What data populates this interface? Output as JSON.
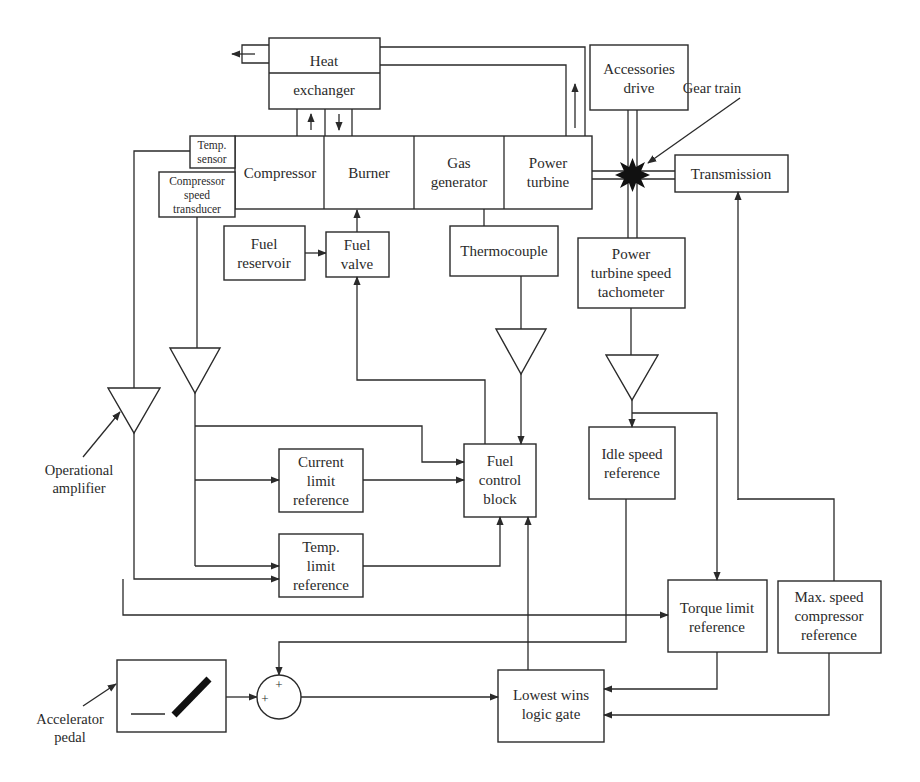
{
  "diagram": {
    "type": "block-diagram",
    "blocks": {
      "heat_exchanger": {
        "line1": "Heat",
        "line2": "exchanger"
      },
      "temp_sensor": {
        "line1": "Temp.",
        "line2": "sensor"
      },
      "compressor_speed_transducer": {
        "line1": "Compressor",
        "line2": "speed",
        "line3": "transducer"
      },
      "compressor": {
        "line1": "Compressor"
      },
      "burner": {
        "line1": "Burner"
      },
      "gas_generator": {
        "line1": "Gas",
        "line2": "generator"
      },
      "power_turbine": {
        "line1": "Power",
        "line2": "turbine"
      },
      "accessories_drive": {
        "line1": "Accessories",
        "line2": "drive"
      },
      "transmission": {
        "line1": "Transmission"
      },
      "fuel_reservoir": {
        "line1": "Fuel",
        "line2": "reservoir"
      },
      "fuel_valve": {
        "line1": "Fuel",
        "line2": "valve"
      },
      "thermocouple": {
        "line1": "Thermocouple"
      },
      "power_turbine_speed_tachometer": {
        "line1": "Power",
        "line2": "turbine speed",
        "line3": "tachometer"
      },
      "current_limit_reference": {
        "line1": "Current",
        "line2": "limit",
        "line3": "reference"
      },
      "fuel_control_block": {
        "line1": "Fuel",
        "line2": "control",
        "line3": "block"
      },
      "idle_speed_reference": {
        "line1": "Idle speed",
        "line2": "reference"
      },
      "temp_limit_reference": {
        "line1": "Temp.",
        "line2": "limit",
        "line3": "reference"
      },
      "torque_limit_reference": {
        "line1": "Torque limit",
        "line2": "reference"
      },
      "max_speed_compressor_reference": {
        "line1": "Max. speed",
        "line2": "compressor",
        "line3": "reference"
      },
      "lowest_wins_logic_gate": {
        "line1": "Lowest wins",
        "line2": "logic gate"
      }
    },
    "annotations": {
      "gear_train": "Gear train",
      "operational_amplifier": {
        "line1": "Operational",
        "line2": "amplifier"
      },
      "accelerator_pedal": {
        "line1": "Accelerator",
        "line2": "pedal"
      }
    },
    "summing_junction": {
      "sign1": "+",
      "sign2": "+"
    },
    "colors": {
      "stroke": "#2a2a2a",
      "background": "#ffffff"
    }
  }
}
